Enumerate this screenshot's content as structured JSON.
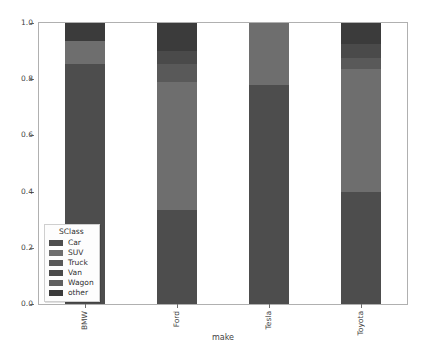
{
  "chart_data": {
    "type": "bar",
    "stacked": true,
    "orientation": "vertical",
    "title": "",
    "xlabel": "make",
    "ylabel": "",
    "categories": [
      "BMW",
      "Ford",
      "Tesla",
      "Toyota"
    ],
    "ylim": [
      0.0,
      1.0
    ],
    "ytick_labels": [
      "0.0",
      "0.2",
      "0.4",
      "0.6",
      "0.8",
      "1.0"
    ],
    "ytick_values": [
      0.0,
      0.2,
      0.4,
      0.6,
      0.8,
      1.0
    ],
    "grid": false,
    "legend_title": "SClass",
    "legend_position": "lower-left-inside",
    "series": [
      {
        "name": "Car",
        "color": "#4d4d4d",
        "values": [
          0.855,
          0.335,
          0.78,
          0.4
        ]
      },
      {
        "name": "SUV",
        "color": "#6e6e6e",
        "values": [
          0.08,
          0.455,
          0.22,
          0.435
        ]
      },
      {
        "name": "Truck",
        "color": "#595959",
        "values": [
          0.0,
          0.065,
          0.0,
          0.04
        ]
      },
      {
        "name": "Van",
        "color": "#4a4a4a",
        "values": [
          0.0,
          0.045,
          0.0,
          0.05
        ]
      },
      {
        "name": "Wagon",
        "color": "#5f5f5f",
        "values": [
          0.0,
          0.0,
          0.0,
          0.0
        ]
      },
      {
        "name": "other",
        "color": "#3b3b3b",
        "values": [
          0.065,
          0.1,
          0.0,
          0.075
        ]
      }
    ]
  },
  "axis": {
    "x_title": "make"
  },
  "legend": {
    "title": "SClass",
    "entries": [
      {
        "label": "Car",
        "color": "#4d4d4d"
      },
      {
        "label": "SUV",
        "color": "#6e6e6e"
      },
      {
        "label": "Truck",
        "color": "#595959"
      },
      {
        "label": "Van",
        "color": "#4a4a4a"
      },
      {
        "label": "Wagon",
        "color": "#5f5f5f"
      },
      {
        "label": "other",
        "color": "#3b3b3b"
      }
    ]
  },
  "style": {
    "axis_color": "#b0b0b0",
    "tick_color": "#6e6e6e",
    "text_color": "#3f3f3f",
    "background": "#ffffff"
  }
}
